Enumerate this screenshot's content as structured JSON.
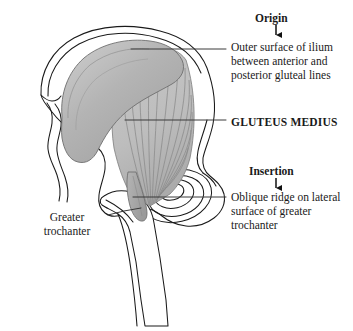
{
  "figure": {
    "view": "lateral view of right hip: ilium, acetabulum, proximal femur",
    "background_color": "#ffffff",
    "bone_outline_color": "#1a1a1a",
    "muscle_fill_color": "#b9b9b9",
    "muscle_belly_color": "#a8a8a8",
    "muscle_fiber_color": "#8a8a8a",
    "leader_line_color": "#3a3a3a",
    "text_color": "#1a1a1a"
  },
  "labels": {
    "origin_heading": "Origin",
    "origin_description": "Outer surface of ilium between anterior and posterior gluteal lines",
    "muscle_name": "GLUTEUS MEDIUS",
    "insertion_heading": "Insertion",
    "insertion_description": "Oblique ridge on lateral surface of greater trochanter",
    "greater_trochanter": "Greater trochanter"
  },
  "icons": {
    "origin_arrow": "down-arrow-icon",
    "insertion_arrow": "down-arrow-icon"
  },
  "leaders": [
    {
      "name": "origin-leader",
      "from_x": 131,
      "from_y": 49,
      "to_x": 226,
      "to_y": 49
    },
    {
      "name": "gluteus-leader",
      "from_x": 125,
      "from_y": 120,
      "to_x": 226,
      "to_y": 120
    },
    {
      "name": "insertion-leader",
      "from_x": 133,
      "from_y": 197,
      "to_x": 226,
      "to_y": 197
    },
    {
      "name": "trochanter-leader",
      "from_x": 108,
      "from_y": 215,
      "to_x": 141,
      "to_y": 209
    }
  ]
}
